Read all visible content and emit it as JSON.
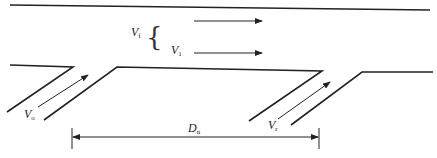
{
  "diagram": {
    "colors": {
      "line": "#222222",
      "background": "#ffffff"
    },
    "labels": {
      "vf": {
        "main": "V",
        "sub": "f"
      },
      "v1": {
        "main": "V",
        "sub": "1"
      },
      "vo": {
        "main": "V",
        "sub": "o"
      },
      "vr": {
        "main": "V",
        "sub": "r"
      },
      "dn": {
        "main": "D",
        "sub": "n"
      }
    },
    "brace": "{"
  }
}
